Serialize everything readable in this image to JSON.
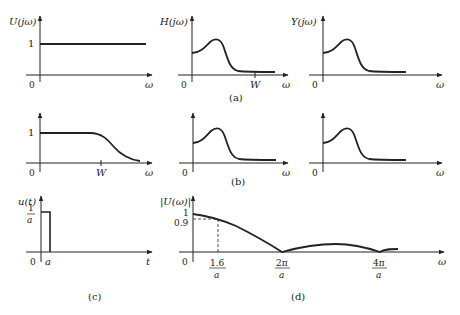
{
  "figure": {
    "panels": {
      "a": {
        "label": "(a)",
        "input": {
          "ylabel": "U(jω)",
          "xlabel": "ω",
          "origin": "0",
          "level": "1"
        },
        "filter": {
          "ylabel": "H(jω)",
          "xlabel": "ω",
          "origin": "0",
          "tick": "W"
        },
        "output": {
          "ylabel": "Y(jω)",
          "xlabel": "ω",
          "origin": "0"
        }
      },
      "b": {
        "label": "(b)",
        "input": {
          "xlabel": "ω",
          "origin": "0",
          "level": "1",
          "tick": "W"
        },
        "filter": {
          "xlabel": "ω",
          "origin": "0"
        },
        "output": {
          "xlabel": "ω",
          "origin": "0"
        }
      },
      "c": {
        "label": "(c)",
        "ylabel": "u(t)",
        "xlabel": "t",
        "origin": "0",
        "height_num": "1",
        "height_den": "a",
        "width": "a"
      },
      "d": {
        "label": "(d)",
        "ylabel": "|U(ω)|",
        "xlabel": "ω",
        "origin": "0",
        "level_1": "1",
        "level_09": "0.9",
        "ticks": [
          {
            "num": "1.6",
            "den": "a"
          },
          {
            "num": "2π",
            "den": "a"
          },
          {
            "num": "4π",
            "den": "a"
          }
        ]
      }
    }
  }
}
